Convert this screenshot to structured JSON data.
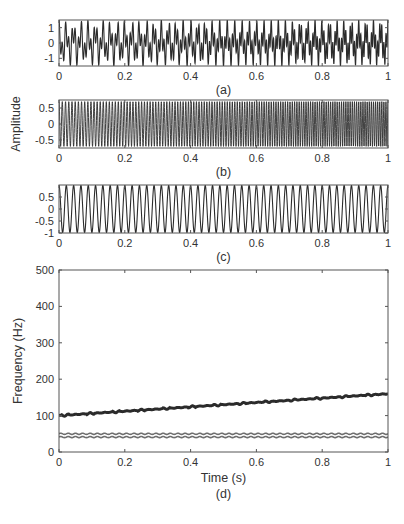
{
  "figure": {
    "width": 404,
    "height": 524,
    "line_color": "#2b2b2b",
    "axis_color": "#555555",
    "band_color": "#6e6e6e"
  },
  "chart_data": [
    {
      "id": "a",
      "type": "line",
      "caption": "(a)",
      "title": "",
      "xlabel": "",
      "ylabel": "",
      "xlim": [
        0,
        1
      ],
      "ylim": [
        -1.5,
        1.5
      ],
      "xticks": [
        0,
        0.2,
        0.4,
        0.6,
        0.8,
        1
      ],
      "xtick_labels": [
        "0",
        "0.2",
        "0.4",
        "0.6",
        "0.8",
        "1"
      ],
      "yticks": [
        1,
        0,
        -1
      ],
      "ytick_labels": [
        "1",
        "0",
        "-1"
      ],
      "grid": false,
      "description": "Composite multicomponent signal: sum of a ~45 Hz tone and a linear chirp 100→160 Hz, amplitude about ±1.5",
      "components": [
        {
          "kind": "sine",
          "freq_hz": 45,
          "amp": 0.75
        },
        {
          "kind": "chirp",
          "f0_hz": 100,
          "f1_hz": 160,
          "amp": 0.75
        }
      ],
      "box": {
        "x": 59,
        "y": 20,
        "w": 329,
        "h": 46
      }
    },
    {
      "id": "b",
      "type": "line",
      "caption": "(b)",
      "title": "",
      "xlabel": "",
      "ylabel": "Amplitude",
      "xlim": [
        0,
        1
      ],
      "ylim": [
        -0.75,
        0.75
      ],
      "xticks": [
        0,
        0.2,
        0.4,
        0.6,
        0.8,
        1
      ],
      "xtick_labels": [
        "0",
        "0.2",
        "0.4",
        "0.6",
        "0.8",
        "1"
      ],
      "yticks": [
        0.5,
        0,
        -0.5
      ],
      "ytick_labels": [
        "0.5",
        "0",
        "-0.5"
      ],
      "grid": false,
      "description": "Chirp component, frequency rising linearly from ~100 Hz to ~160 Hz, amplitude ~0.7",
      "components": [
        {
          "kind": "chirp",
          "f0_hz": 100,
          "f1_hz": 160,
          "amp": 0.7
        }
      ],
      "box": {
        "x": 59,
        "y": 100,
        "w": 329,
        "h": 48
      }
    },
    {
      "id": "c",
      "type": "line",
      "caption": "(c)",
      "title": "",
      "xlabel": "",
      "ylabel": "",
      "xlim": [
        0,
        1
      ],
      "ylim": [
        -1,
        1
      ],
      "xticks": [
        0,
        0.2,
        0.4,
        0.6,
        0.8,
        1
      ],
      "xtick_labels": [
        "0",
        "0.2",
        "0.4",
        "0.6",
        "0.8",
        "1"
      ],
      "yticks": [
        0.5,
        0,
        -0.5,
        -1
      ],
      "ytick_labels": [
        "0.5",
        "0",
        "-0.5",
        "-1"
      ],
      "grid": false,
      "description": "Pure tone at ~45 Hz, amplitude ~1",
      "components": [
        {
          "kind": "sine",
          "freq_hz": 45,
          "amp": 0.98
        }
      ],
      "box": {
        "x": 59,
        "y": 185,
        "w": 329,
        "h": 48
      }
    },
    {
      "id": "d",
      "type": "line",
      "caption": "(d)",
      "title": "",
      "xlabel": "Time (s)",
      "ylabel": "Frequency (Hz)",
      "xlim": [
        0,
        1
      ],
      "ylim": [
        0,
        500
      ],
      "xticks": [
        0,
        0.2,
        0.4,
        0.6,
        0.8,
        1
      ],
      "xtick_labels": [
        "0",
        "0.2",
        "0.4",
        "0.6",
        "0.8",
        "1"
      ],
      "yticks": [
        500,
        400,
        300,
        200,
        100,
        0
      ],
      "ytick_labels": [
        "500",
        "400",
        "300",
        "200",
        "100",
        "0"
      ],
      "grid": false,
      "series": [
        {
          "name": "chirp instantaneous frequency",
          "x": [
            0,
            0.2,
            0.4,
            0.6,
            0.8,
            1.0
          ],
          "values": [
            100,
            112,
            124,
            136,
            148,
            160
          ]
        },
        {
          "name": "tone instantaneous frequency (upper edge)",
          "x": [
            0,
            0.2,
            0.4,
            0.6,
            0.8,
            1.0
          ],
          "values": [
            50,
            50,
            50,
            50,
            50,
            50
          ]
        },
        {
          "name": "tone instantaneous frequency (lower edge)",
          "x": [
            0,
            0.2,
            0.4,
            0.6,
            0.8,
            1.0
          ],
          "values": [
            41,
            41,
            41,
            41,
            41,
            41
          ]
        }
      ],
      "box": {
        "x": 59,
        "y": 270,
        "w": 329,
        "h": 182
      }
    }
  ]
}
